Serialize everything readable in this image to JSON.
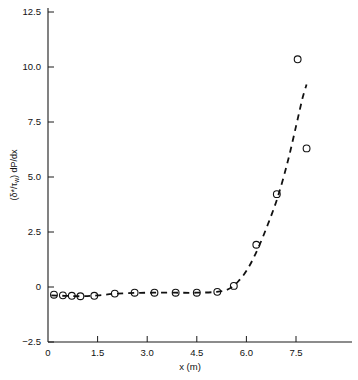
{
  "chart_data": {
    "type": "scatter",
    "title": "",
    "subtitle": "",
    "xlabel": "x (m)",
    "ylabel": "(δ*/τw) dP/dx",
    "ylabel_parts": {
      "open_paren": "(",
      "delta_star": "δ*",
      "slash": "/",
      "tau": "τ",
      "tau_sub": "w",
      "close_paren": ") ",
      "derivative": "dP/dx"
    },
    "xlim": [
      0.0,
      8.6
    ],
    "ylim": [
      -2.5,
      12.5
    ],
    "xticks": [
      0,
      1.5,
      3.0,
      4.5,
      6.0,
      7.5
    ],
    "xtick_labels": [
      "0",
      "1.5",
      "3.0",
      "4.5",
      "6.0",
      "7.5"
    ],
    "yticks": [
      -2.5,
      0,
      2.5,
      5.0,
      7.5,
      10.0,
      12.5
    ],
    "ytick_labels": [
      "-2.5",
      "0",
      "2.5",
      "5.0",
      "7.5",
      "10.0",
      "12.5"
    ],
    "grid": false,
    "legend": null,
    "legend_position": "none",
    "marker_style": "open-circle",
    "marker_radius_px": 3.4,
    "line_style": "dashed",
    "series": [
      {
        "name": "measured data",
        "type": "scatter",
        "marker": "open-circle",
        "color": "#111111",
        "points": [
          {
            "x": 0.18,
            "y": -0.35
          },
          {
            "x": 0.45,
            "y": -0.38
          },
          {
            "x": 0.72,
            "y": -0.4
          },
          {
            "x": 0.98,
            "y": -0.42
          },
          {
            "x": 1.4,
            "y": -0.4
          },
          {
            "x": 2.02,
            "y": -0.3
          },
          {
            "x": 2.62,
            "y": -0.26
          },
          {
            "x": 3.22,
            "y": -0.26
          },
          {
            "x": 3.86,
            "y": -0.26
          },
          {
            "x": 4.5,
            "y": -0.26
          },
          {
            "x": 5.12,
            "y": -0.22
          },
          {
            "x": 5.62,
            "y": 0.05
          },
          {
            "x": 6.3,
            "y": 1.92
          },
          {
            "x": 6.92,
            "y": 4.22
          },
          {
            "x": 7.55,
            "y": 10.35
          },
          {
            "x": 7.82,
            "y": 6.3
          }
        ]
      },
      {
        "name": "fitted curve",
        "type": "line",
        "style": "dashed",
        "color": "#111111",
        "points": [
          {
            "x": 0.1,
            "y": -0.38
          },
          {
            "x": 0.5,
            "y": -0.4
          },
          {
            "x": 1.0,
            "y": -0.42
          },
          {
            "x": 1.5,
            "y": -0.38
          },
          {
            "x": 2.0,
            "y": -0.31
          },
          {
            "x": 2.6,
            "y": -0.27
          },
          {
            "x": 3.2,
            "y": -0.26
          },
          {
            "x": 3.85,
            "y": -0.26
          },
          {
            "x": 4.5,
            "y": -0.26
          },
          {
            "x": 5.1,
            "y": -0.22
          },
          {
            "x": 5.45,
            "y": -0.1
          },
          {
            "x": 5.75,
            "y": 0.25
          },
          {
            "x": 6.05,
            "y": 0.85
          },
          {
            "x": 6.35,
            "y": 1.75
          },
          {
            "x": 6.65,
            "y": 2.85
          },
          {
            "x": 6.95,
            "y": 4.1
          },
          {
            "x": 7.25,
            "y": 5.7
          },
          {
            "x": 7.5,
            "y": 7.3
          },
          {
            "x": 7.7,
            "y": 8.6
          },
          {
            "x": 7.82,
            "y": 9.2
          }
        ]
      }
    ]
  },
  "figure": {
    "background_color": "#ffffff",
    "axis_color": "#1a1a1a",
    "data_color": "#111111"
  }
}
